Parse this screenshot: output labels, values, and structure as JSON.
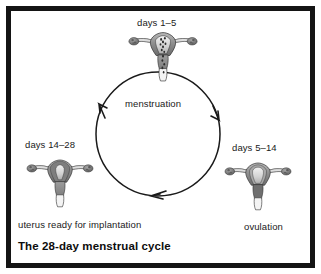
{
  "figure": {
    "title": "The 28-day menstrual cycle",
    "type": "cycle-diagram",
    "frame_color": "#141414",
    "background_color": "#ffffff",
    "text_color": "#1a1a1a"
  },
  "cycle": {
    "direction": "clockwise",
    "center": {
      "x": 158,
      "y": 134
    },
    "radius": 62,
    "center_label": "menstruation",
    "stages": [
      {
        "id": "menstruation",
        "position": "top",
        "days_label": "days 1–5",
        "description": "menstruation",
        "lining": "shedding"
      },
      {
        "id": "ovulation",
        "position": "right",
        "days_label": "days 5–14",
        "description": "ovulation",
        "lining": "rebuilding"
      },
      {
        "id": "implantation-ready",
        "position": "left",
        "days_label": "days 14–28",
        "description": "uterus ready for implantation",
        "lining": "thickened"
      }
    ],
    "arrows": [
      {
        "name": "arrow-top-right",
        "angle_deg": 320,
        "points": "down"
      },
      {
        "name": "arrow-bottom",
        "angle_deg": 100,
        "points": "left"
      },
      {
        "name": "arrow-top-left",
        "angle_deg": 215,
        "points": "up"
      }
    ]
  },
  "colors": {
    "uterus_outline": "#2b2b2b",
    "uterus_body_light": "#d8d8d8",
    "uterus_body_mid": "#9a9a9a",
    "uterus_body_dark": "#6e6e6e",
    "cervix": "#8c8c8c",
    "ovary": "#7d7d7d",
    "blood": "#3a3a3a",
    "circle_stroke": "#1a1a1a"
  }
}
